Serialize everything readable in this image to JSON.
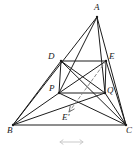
{
  "figure": {
    "title": "",
    "type": "geometry-diagram",
    "stroke_color": "#1c1c1c",
    "dash_color": "#8a8a8a",
    "background": "#ffffff",
    "canvas": {
      "width": 137,
      "height": 150
    }
  },
  "points": {
    "A": {
      "label": "A",
      "x": 97,
      "y": 17,
      "label_x": 94,
      "label_y": 3
    },
    "B": {
      "label": "B",
      "x": 13,
      "y": 125,
      "label_x": 7,
      "label_y": 126
    },
    "C": {
      "label": "C",
      "x": 126,
      "y": 125,
      "label_x": 126,
      "label_y": 126
    },
    "D": {
      "label": "D",
      "x": 61,
      "y": 61,
      "label_x": 48,
      "label_y": 52
    },
    "E": {
      "label": "E",
      "x": 106,
      "y": 61,
      "label_x": 109,
      "label_y": 52
    },
    "P": {
      "label": "P",
      "x": 59,
      "y": 93,
      "label_x": 49,
      "label_y": 84
    },
    "Q": {
      "label": "Q",
      "x": 105,
      "y": 93,
      "label_x": 107,
      "label_y": 86
    },
    "Ep": {
      "label": "E'",
      "x": 69,
      "y": 112,
      "label_x": 62,
      "label_y": 113
    }
  },
  "segments": [
    {
      "name": "AB",
      "from": "A",
      "to": "B"
    },
    {
      "name": "AC",
      "from": "A",
      "to": "C"
    },
    {
      "name": "BC",
      "from": "B",
      "to": "C"
    },
    {
      "name": "DE",
      "from": "D",
      "to": "E"
    },
    {
      "name": "PQ",
      "from": "P",
      "to": "Q"
    },
    {
      "name": "DP",
      "from": "D",
      "to": "P"
    },
    {
      "name": "EQ",
      "from": "E",
      "to": "Q"
    },
    {
      "name": "DQ",
      "from": "D",
      "to": "Q"
    },
    {
      "name": "EP",
      "from": "E",
      "to": "P"
    },
    {
      "name": "AP",
      "from": "A",
      "to": "P"
    },
    {
      "name": "AQ",
      "from": "A",
      "to": "Q"
    },
    {
      "name": "BD",
      "from": "B",
      "to": "D"
    },
    {
      "name": "BP",
      "from": "B",
      "to": "P"
    },
    {
      "name": "BQ",
      "from": "B",
      "to": "Q"
    },
    {
      "name": "CE",
      "from": "C",
      "to": "E"
    },
    {
      "name": "CQ",
      "from": "C",
      "to": "Q"
    },
    {
      "name": "CP",
      "from": "C",
      "to": "P"
    },
    {
      "name": "CD",
      "from": "C",
      "to": "D"
    }
  ],
  "dashed_arrow": {
    "name": "E-to-Eprime-translation-arrow",
    "from": "E",
    "to": "Ep",
    "style": "dashed",
    "arrowhead": true
  },
  "bottom_mark": {
    "name": "double-headed-axis-mark",
    "x1": 60,
    "x2": 83,
    "y": 142,
    "visible": true
  }
}
